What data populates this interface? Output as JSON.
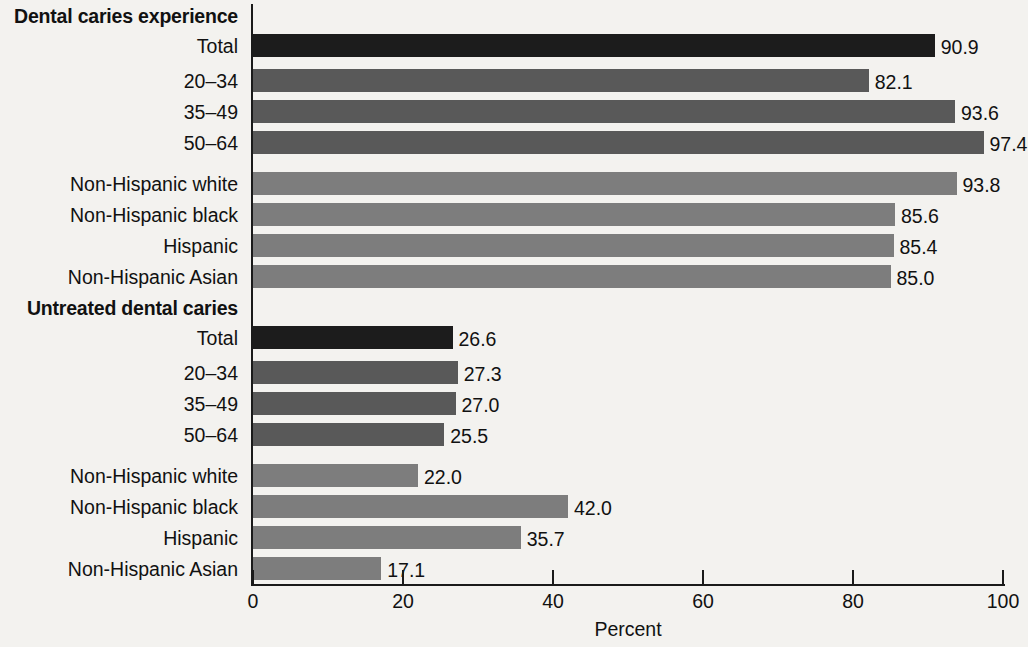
{
  "chart_data": {
    "type": "bar",
    "orientation": "horizontal",
    "title": "",
    "xlabel": "Percent",
    "ylabel": "",
    "xlim": [
      0,
      100
    ],
    "xticks": [
      0,
      20,
      40,
      60,
      80,
      100
    ],
    "xtick_labels": [
      "0",
      "20",
      "40",
      "60",
      "80",
      "100"
    ],
    "grid": false,
    "legend": null,
    "groups": [
      {
        "label": "Dental caries experience",
        "rows": [
          {
            "category": "Total",
            "value": 90.9,
            "value_label": "90.9",
            "shade": "dark"
          },
          {
            "category": "20–34",
            "value": 82.1,
            "value_label": "82.1",
            "shade": "medium"
          },
          {
            "category": "35–49",
            "value": 93.6,
            "value_label": "93.6",
            "shade": "medium"
          },
          {
            "category": "50–64",
            "value": 97.4,
            "value_label": "97.4",
            "shade": "medium"
          },
          {
            "category": "Non-Hispanic white",
            "value": 93.8,
            "value_label": "93.8",
            "shade": "light"
          },
          {
            "category": "Non-Hispanic black",
            "value": 85.6,
            "value_label": "85.6",
            "shade": "light"
          },
          {
            "category": "Hispanic",
            "value": 85.4,
            "value_label": "85.4",
            "shade": "light"
          },
          {
            "category": "Non-Hispanic Asian",
            "value": 85.0,
            "value_label": "85.0",
            "shade": "light"
          }
        ]
      },
      {
        "label": "Untreated dental caries",
        "rows": [
          {
            "category": "Total",
            "value": 26.6,
            "value_label": "26.6",
            "shade": "dark"
          },
          {
            "category": "20–34",
            "value": 27.3,
            "value_label": "27.3",
            "shade": "medium"
          },
          {
            "category": "35–49",
            "value": 27.0,
            "value_label": "27.0",
            "shade": "medium"
          },
          {
            "category": "50–64",
            "value": 25.5,
            "value_label": "25.5",
            "shade": "medium"
          },
          {
            "category": "Non-Hispanic white",
            "value": 22.0,
            "value_label": "22.0",
            "shade": "light"
          },
          {
            "category": "Non-Hispanic black",
            "value": 42.0,
            "value_label": "42.0",
            "shade": "light"
          },
          {
            "category": "Hispanic",
            "value": 35.7,
            "value_label": "35.7",
            "shade": "light"
          },
          {
            "category": "Non-Hispanic Asian",
            "value": 17.1,
            "value_label": "17.1",
            "shade": "light"
          }
        ]
      }
    ],
    "colors": {
      "dark": "#1c1c1c",
      "medium": "#595959",
      "light": "#7d7d7d",
      "axis": "#1a1a1a",
      "text": "#111111",
      "background": "#f3f2ef"
    }
  }
}
